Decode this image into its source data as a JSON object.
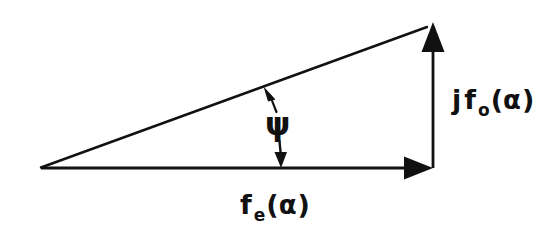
{
  "figure": {
    "background_color": "#ffffff",
    "stroke_color": "#111111",
    "width": 553,
    "height": 239
  },
  "labels": {
    "imaginary_component": {
      "prefix": "j",
      "function": "f",
      "subscript": "o",
      "open_paren": "(",
      "argument": "α",
      "close_paren": ")",
      "full_text": "jf₀(α)"
    },
    "real_component": {
      "prefix": "",
      "function": "f",
      "subscript": "e",
      "open_paren": "(",
      "argument": "α",
      "close_paren": ")",
      "full_text": "fₑ(α)"
    },
    "angle": {
      "symbol": "ψ",
      "name": "psi"
    }
  },
  "geometry": {
    "origin": {
      "x": 41,
      "y": 168
    },
    "real_vector_tip": {
      "x": 433,
      "y": 168
    },
    "imaginary_vector_tip": {
      "x": 433,
      "y": 23
    },
    "resultant_tip": {
      "x": 433,
      "y": 23
    },
    "angle_indicator": {
      "top_point": {
        "x": 268,
        "y": 87
      },
      "bottom_point": {
        "x": 281,
        "y": 167
      }
    }
  }
}
